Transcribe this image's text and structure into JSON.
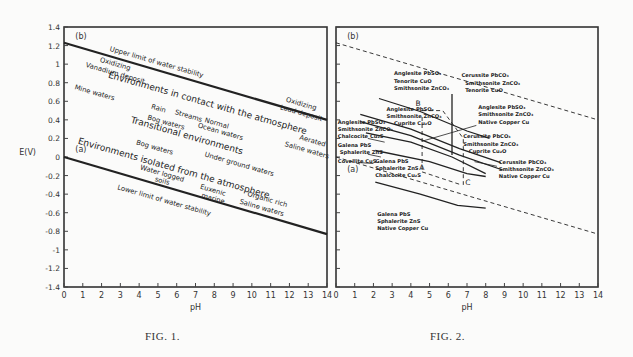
{
  "chart_data": [
    {
      "type": "line",
      "title": "FIG. 1.",
      "xlabel": "pH",
      "ylabel": "E(V)",
      "xlim": [
        0,
        14
      ],
      "ylim": [
        -1.4,
        1.4
      ],
      "x_ticks": [
        0,
        1,
        2,
        3,
        4,
        5,
        6,
        7,
        8,
        9,
        10,
        11,
        12,
        13,
        14
      ],
      "y_ticks": [
        "1.4",
        "1.2",
        "1",
        "0.8",
        "0.6",
        "0.4",
        "0.2",
        "0",
        "-0.2",
        "-0.4",
        "-0.6",
        "-0.8",
        "-1",
        "-1.2",
        "-1.4"
      ],
      "grid": false,
      "series": [
        {
          "name": "(b) Upper limit of water stability",
          "style": "solid",
          "points": [
            [
              0,
              1.23
            ],
            [
              14,
              0.4
            ]
          ]
        },
        {
          "name": "(a) Lower limit of water stability",
          "style": "solid",
          "points": [
            [
              0,
              0.0
            ],
            [
              14,
              -0.83
            ]
          ]
        }
      ],
      "line_labels": [
        "(b)",
        "(a)"
      ],
      "annotations": [
        {
          "text": "Upper limit of water stability",
          "x": 4.9,
          "y": 1.0,
          "rot": 16
        },
        {
          "text": "Oxidizing",
          "x": 2.7,
          "y": 0.98,
          "rot": 16
        },
        {
          "text": "Vanadium deposit",
          "x": 2.7,
          "y": 0.88,
          "rot": 16
        },
        {
          "text": "Mine waters",
          "x": 1.6,
          "y": 0.67,
          "rot": 16
        },
        {
          "text": "Environments in contact with the atmosphere",
          "x": 7.6,
          "y": 0.55,
          "rot": 16,
          "size": 9
        },
        {
          "text": "Rain",
          "x": 5.0,
          "y": 0.5,
          "rot": 16
        },
        {
          "text": "Streams",
          "x": 6.6,
          "y": 0.42,
          "rot": 16
        },
        {
          "text": "Normal",
          "x": 8.1,
          "y": 0.34,
          "rot": 16
        },
        {
          "text": "Ocean waters",
          "x": 8.3,
          "y": 0.25,
          "rot": 16
        },
        {
          "text": "Bog waters",
          "x": 5.4,
          "y": 0.35,
          "rot": 16
        },
        {
          "text": "Transitional environments",
          "x": 6.5,
          "y": 0.2,
          "rot": 16,
          "size": 9
        },
        {
          "text": "Oxidizing",
          "x": 12.6,
          "y": 0.55,
          "rot": 16
        },
        {
          "text": "Lead deposit",
          "x": 12.6,
          "y": 0.45,
          "rot": 16
        },
        {
          "text": "Aerated",
          "x": 13.2,
          "y": 0.15,
          "rot": 16
        },
        {
          "text": "Saline waters",
          "x": 12.9,
          "y": 0.05,
          "rot": 16
        },
        {
          "text": "Bog waters",
          "x": 4.8,
          "y": 0.08,
          "rot": 16
        },
        {
          "text": "Environments isolated from the atmosphere",
          "x": 5.8,
          "y": -0.15,
          "rot": 16,
          "size": 9
        },
        {
          "text": "Water logged",
          "x": 5.2,
          "y": -0.2,
          "rot": 16
        },
        {
          "text": "soils",
          "x": 5.2,
          "y": -0.28,
          "rot": 16
        },
        {
          "text": "Under ground waters",
          "x": 9.3,
          "y": -0.1,
          "rot": 16
        },
        {
          "text": "Euxenic",
          "x": 7.9,
          "y": -0.38,
          "rot": 16
        },
        {
          "text": "marine",
          "x": 7.9,
          "y": -0.47,
          "rot": 16
        },
        {
          "text": "Organic rich",
          "x": 10.8,
          "y": -0.48,
          "rot": 16
        },
        {
          "text": "Saline waters",
          "x": 10.5,
          "y": -0.57,
          "rot": 16
        },
        {
          "text": "Lower limit of water stability",
          "x": 5.3,
          "y": -0.49,
          "rot": 16
        }
      ]
    },
    {
      "type": "line",
      "title": "FIG. 2.",
      "xlabel": "pH",
      "ylabel": "",
      "xlim": [
        0,
        14
      ],
      "ylim": [
        -1.4,
        1.4
      ],
      "x_ticks": [
        0,
        1,
        2,
        3,
        4,
        5,
        6,
        7,
        8,
        9,
        10,
        11,
        12,
        13,
        14
      ],
      "grid": false,
      "series": [
        {
          "name": "(b) upper water limit",
          "style": "dashed",
          "points": [
            [
              0,
              1.23
            ],
            [
              14,
              0.4
            ]
          ]
        },
        {
          "name": "(a) lower water limit",
          "style": "dashed",
          "points": [
            [
              0,
              0.0
            ],
            [
              14,
              -0.83
            ]
          ]
        },
        {
          "name": "boundary 1",
          "style": "solid",
          "points": [
            [
              2.3,
              0.63
            ],
            [
              4.5,
              0.49
            ],
            [
              7.0,
              0.28
            ],
            [
              8.2,
              0.2
            ]
          ]
        },
        {
          "name": "boundary 2",
          "style": "solid",
          "points": [
            [
              1.3,
              0.46
            ],
            [
              4.0,
              0.3
            ],
            [
              6.6,
              0.09
            ],
            [
              8.8,
              -0.06
            ]
          ]
        },
        {
          "name": "boundary 3",
          "style": "solid",
          "points": [
            [
              1.3,
              0.38
            ],
            [
              4.0,
              0.23
            ],
            [
              6.6,
              0.02
            ],
            [
              8.9,
              -0.14
            ]
          ]
        },
        {
          "name": "boundary 4",
          "style": "solid",
          "points": [
            [
              1.6,
              0.26
            ],
            [
              4.0,
              0.16
            ],
            [
              6.2,
              0.0
            ],
            [
              8.0,
              -0.18
            ]
          ]
        },
        {
          "name": "boundary 5",
          "style": "solid",
          "points": [
            [
              2.1,
              0.07
            ],
            [
              5.0,
              -0.05
            ],
            [
              7.0,
              -0.18
            ],
            [
              8.0,
              -0.21
            ]
          ]
        },
        {
          "name": "boundary 6",
          "style": "solid",
          "points": [
            [
              2.1,
              -0.27
            ],
            [
              4.5,
              -0.4
            ],
            [
              6.5,
              -0.52
            ],
            [
              8.0,
              -0.55
            ]
          ]
        },
        {
          "name": "vertical boundary",
          "style": "solid",
          "points": [
            [
              6.2,
              0.68
            ],
            [
              6.2,
              0.02
            ]
          ]
        },
        {
          "name": "path A-B",
          "style": "dashed",
          "points": [
            [
              4.6,
              -0.14
            ],
            [
              4.6,
              0.45
            ]
          ]
        },
        {
          "name": "path B-C",
          "style": "dashed",
          "points": [
            [
              4.6,
              0.5
            ],
            [
              5.7,
              0.5
            ],
            [
              6.8,
              0.2
            ],
            [
              6.8,
              -0.3
            ]
          ]
        },
        {
          "name": "path A-C",
          "style": "dashed",
          "points": [
            [
              4.6,
              -0.16
            ],
            [
              6.7,
              -0.3
            ]
          ]
        }
      ],
      "point_labels": [
        {
          "text": "A",
          "x": 4.45,
          "y": -0.14
        },
        {
          "text": "B",
          "x": 4.25,
          "y": 0.55
        },
        {
          "text": "C",
          "x": 6.9,
          "y": -0.3
        }
      ],
      "line_labels": [
        "(b)",
        "(a)"
      ],
      "annotations": [
        {
          "text": "Anglesite PbSO4",
          "x": 3.1,
          "y": 0.88
        },
        {
          "text": "Tenorite CuO",
          "x": 3.1,
          "y": 0.8
        },
        {
          "text": "Smithsonite ZnCO3",
          "x": 3.1,
          "y": 0.72
        },
        {
          "text": "Cerussite PbCO3",
          "x": 6.7,
          "y": 0.86
        },
        {
          "text": "Smithsonite ZnCO3",
          "x": 6.9,
          "y": 0.78
        },
        {
          "text": "Tenorite CuO",
          "x": 6.9,
          "y": 0.7
        },
        {
          "text": "Anglesite PbSO4",
          "x": 2.7,
          "y": 0.5
        },
        {
          "text": "Smithsonite ZnCO3",
          "x": 2.7,
          "y": 0.42
        },
        {
          "text": "Cuprite Cu2O",
          "x": 3.1,
          "y": 0.34
        },
        {
          "text": "Anglesite PbSO4",
          "x": 7.6,
          "y": 0.52
        },
        {
          "text": "Smithsonite ZnCO3",
          "x": 7.6,
          "y": 0.44
        },
        {
          "text": "Native Copper Cu",
          "x": 7.6,
          "y": 0.36
        },
        {
          "text": "Anglesite PbSO4",
          "x": 0.1,
          "y": 0.36
        },
        {
          "text": "Smithsonite ZnCO3",
          "x": 0.1,
          "y": 0.28
        },
        {
          "text": "Chalcocite Cu2S",
          "x": 0.1,
          "y": 0.2
        },
        {
          "text": "Galena PbS",
          "x": 0.1,
          "y": 0.11
        },
        {
          "text": "Sphalerite ZnS",
          "x": 0.2,
          "y": 0.03
        },
        {
          "text": "Covellite CuS",
          "x": 0.1,
          "y": -0.06
        },
        {
          "text": "Cerussite PbCO3",
          "x": 6.8,
          "y": 0.2
        },
        {
          "text": "Smithsonite ZnCO3",
          "x": 6.8,
          "y": 0.12
        },
        {
          "text": "Cuprite Cu2O",
          "x": 7.1,
          "y": 0.04
        },
        {
          "text": "Cerussite PbCO3",
          "x": 8.7,
          "y": -0.07
        },
        {
          "text": "Smithsonite ZnCO3",
          "x": 8.7,
          "y": -0.15
        },
        {
          "text": "Native Copper Cu",
          "x": 8.7,
          "y": -0.23
        },
        {
          "text": "Galena PbS",
          "x": 2.1,
          "y": -0.06
        },
        {
          "text": "Sphalerite ZnS",
          "x": 2.1,
          "y": -0.14
        },
        {
          "text": "Chalcocite Cu2S",
          "x": 2.1,
          "y": -0.22
        },
        {
          "text": "Galena PbS",
          "x": 2.2,
          "y": -0.63
        },
        {
          "text": "Sphalerite ZnS",
          "x": 2.2,
          "y": -0.71
        },
        {
          "text": "Native Copper Cu",
          "x": 2.2,
          "y": -0.79
        }
      ]
    }
  ],
  "figures": {
    "fig1": {
      "caption": "FIG. 1.",
      "y_axis_label": "E(V)",
      "x_axis_label": "pH",
      "line_b": "(b)",
      "line_a": "(a)"
    },
    "fig2": {
      "caption": "FIG. 2.",
      "x_axis_label": "pH",
      "line_b": "(b)",
      "line_a": "(a)"
    }
  }
}
